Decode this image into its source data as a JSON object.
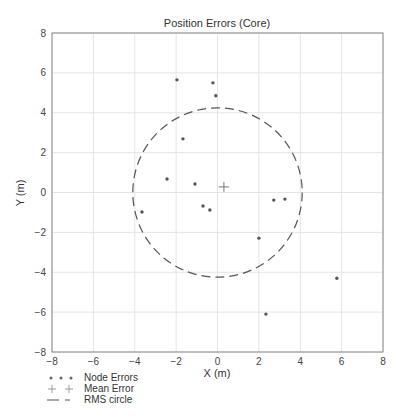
{
  "chart_data": {
    "type": "scatter",
    "title": "Position Errors (Core)",
    "xlabel": "X (m)",
    "ylabel": "Y (m)",
    "xlim": [
      -8,
      8
    ],
    "ylim": [
      -8,
      8
    ],
    "xticks": [
      -8,
      -6,
      -4,
      -2,
      0,
      2,
      4,
      6,
      8
    ],
    "yticks": [
      -8,
      -6,
      -4,
      -2,
      0,
      2,
      4,
      6,
      8
    ],
    "grid": true,
    "legend_position": "below-left",
    "series": [
      {
        "name": "Node Errors",
        "marker": "dot",
        "points": [
          [
            -1.96,
            5.65
          ],
          [
            -0.22,
            5.5
          ],
          [
            -0.08,
            4.85
          ],
          [
            -1.67,
            2.69
          ],
          [
            -2.44,
            0.68
          ],
          [
            -1.09,
            0.43
          ],
          [
            -0.7,
            -0.68
          ],
          [
            -0.37,
            -0.88
          ],
          [
            -3.65,
            -0.98
          ],
          [
            2.72,
            -0.38
          ],
          [
            3.26,
            -0.33
          ],
          [
            2.0,
            -2.29
          ],
          [
            5.77,
            -4.3
          ],
          [
            2.34,
            -6.1
          ]
        ]
      },
      {
        "name": "Mean Error",
        "marker": "plus",
        "points": [
          [
            0.31,
            0.28
          ]
        ]
      },
      {
        "name": "RMS circle",
        "marker": "dashed-circle",
        "center": [
          0,
          0
        ],
        "radius": 4.17
      }
    ]
  },
  "legend": {
    "items": [
      {
        "label": "Node Errors"
      },
      {
        "label": "Mean Error"
      },
      {
        "label": "RMS circle"
      }
    ]
  },
  "colors": {
    "points": "#555555",
    "grid": "#e4e4e4",
    "axis": "#888888",
    "circle": "#555555"
  }
}
